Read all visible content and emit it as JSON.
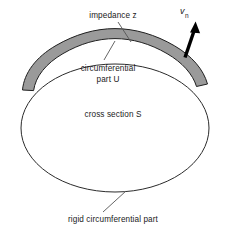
{
  "figure": {
    "type": "technical-line-diagram",
    "background_color": "#ffffff",
    "canvas": {
      "width": 227,
      "height": 232
    }
  },
  "labels": {
    "impedance": "impedance z",
    "circumferential_line1": "circumferential",
    "circumferential_line2": "part U",
    "cross_section": "cross section S",
    "rigid_part": "rigid circumferential part",
    "normal_velocity_symbol": "v",
    "normal_velocity_subscript": "n"
  },
  "geometry": {
    "ellipse": {
      "center_x": 115,
      "center_y": 128,
      "radius_x": 94,
      "radius_y": 64,
      "stroke_color": "#2b2b2b",
      "stroke_width": 1,
      "fill_color": "#ffffff"
    },
    "impedance_band": {
      "description": "shaded circumferential arc segment of thickness ~12px spanning the upper portion of the ellipse",
      "fill_color": "#9a9a9a",
      "stroke_color": "#1f1f1f",
      "stroke_width": 1,
      "thickness": 12,
      "start_angle_deg": 192,
      "end_angle_deg": 333
    },
    "normal_velocity_arrow": {
      "tail_x": 186,
      "tail_y": 56,
      "tip_x": 196,
      "tip_y": 23,
      "color": "#000000",
      "shaft_width": 3.4
    },
    "leader_lines": [
      {
        "name": "impedance-leader",
        "x1": 118,
        "y1": 22,
        "x2": 131,
        "y2": 42,
        "stroke_color": "#555555"
      },
      {
        "name": "circumferential-leader",
        "x1": 115,
        "y1": 43,
        "x2": 104,
        "y2": 60,
        "stroke_color": "#555555"
      },
      {
        "name": "rigid-part-leader",
        "x1": 125,
        "y1": 192,
        "x2": 103,
        "y2": 212,
        "stroke_color": "#555555"
      }
    ]
  },
  "colors": {
    "band_fill": "#9a9a9a",
    "outline": "#2b2b2b",
    "text": "#1a1a1a",
    "arrow": "#000000",
    "leader": "#555555"
  }
}
